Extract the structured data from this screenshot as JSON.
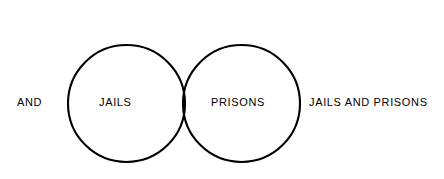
{
  "figure": {
    "caption_line1": "Figure 3.1",
    "caption_line2": "Jails AND Prisons"
  },
  "labels": {
    "operator": "AND",
    "left_set": "JAILS",
    "right_set": "PRISONS",
    "result": "JAILS AND PRISONS"
  },
  "colors": {
    "background": "#ffffff",
    "stroke": "#000000",
    "intersection_fill": "#9a9a9a",
    "hatch_line": "#000000",
    "text": "#000000"
  },
  "geometry": {
    "canvas_width": 444,
    "canvas_height": 179,
    "left_circle": {
      "cx": 126.5,
      "cy": 103.5,
      "r": 58.5
    },
    "right_circle": {
      "cx": 241.5,
      "cy": 103.5,
      "r": 58.5
    },
    "stroke_width": 2.1,
    "hatch_angle_deg": 45,
    "hatch_spacing": 2
  }
}
